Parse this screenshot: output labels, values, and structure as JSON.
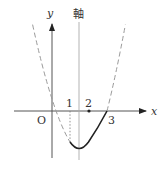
{
  "diagram": {
    "type": "parabola-graph",
    "labels": {
      "y_axis": "y",
      "x_axis": "x",
      "axis_of_symmetry": "軸",
      "origin": "O",
      "tick_1": "1",
      "tick_2": "2",
      "tick_3": "3"
    },
    "function": {
      "form": "y = a·x(x − 3)",
      "roots": [
        0,
        3
      ],
      "axis_of_symmetry_x": 1.5,
      "solid_domain": [
        1,
        3
      ],
      "dashed_outside_domain": true
    },
    "marked_points": [
      {
        "x": 1,
        "style": "dotted-vertical-guide"
      },
      {
        "x": 2,
        "style": "dot-on-x-axis"
      },
      {
        "x": 3,
        "style": "root"
      }
    ],
    "colors": {
      "axis": "#444444",
      "curve": "#222222",
      "dashed": "#9a9a9a",
      "symmetry_axis": "#999999"
    }
  }
}
